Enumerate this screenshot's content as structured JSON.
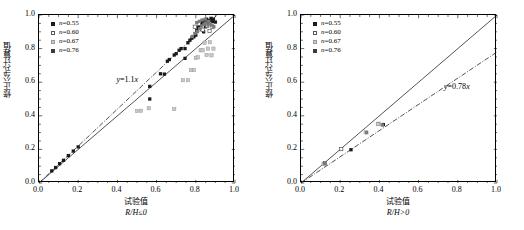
{
  "figure": {
    "panels": [
      {
        "id": "left",
        "condition_label": "R/H≤0",
        "xlabel": "试验值",
        "ylabel": "修正公式计算值",
        "equation": "y=1.1x",
        "equation_slope": 1.1
      },
      {
        "id": "right",
        "condition_label": "R/H>0",
        "xlabel": "试验值",
        "ylabel": "修正公式计算值",
        "equation": "y=0.78x",
        "equation_slope": 0.78
      }
    ],
    "legend": [
      {
        "label": "n=0.55",
        "marker": "filled-square",
        "color": "#1a1a1a"
      },
      {
        "label": "n=0.60",
        "marker": "open-square",
        "color": "#ffffff"
      },
      {
        "label": "n=0.67",
        "marker": "light-square",
        "color": "#c8c8c8"
      },
      {
        "label": "n=0.76",
        "marker": "filled-square",
        "color": "#3a3a3a"
      }
    ],
    "ticks": {
      "x": [
        "0.0",
        "0.2",
        "0.4",
        "0.6",
        "0.8",
        "1.0"
      ],
      "y": [
        "0.0",
        "0.2",
        "0.4",
        "0.6",
        "0.8",
        "1.0"
      ]
    }
  },
  "chart_data": [
    {
      "type": "scatter",
      "panel": "left",
      "title": "",
      "xlabel": "试验值 R/H≤0",
      "ylabel": "修正公式计算值",
      "xlim": [
        0.0,
        1.0
      ],
      "ylim": [
        0.0,
        1.0
      ],
      "grid": false,
      "legend_position": "top-left",
      "annotations": [
        {
          "text": "y=1.1x",
          "x": 0.4,
          "y": 0.605
        }
      ],
      "reference_lines": [
        {
          "name": "one-to-one",
          "style": "solid",
          "slope": 1.0,
          "intercept": 0.0
        },
        {
          "name": "fit",
          "style": "dash-dot",
          "slope": 1.1,
          "intercept": 0.0
        }
      ],
      "series": [
        {
          "name": "n=0.55",
          "marker": "filled-square",
          "color": "#1a1a1a",
          "points": [
            [
              0.065,
              0.072
            ],
            [
              0.085,
              0.092
            ],
            [
              0.105,
              0.115
            ],
            [
              0.125,
              0.135
            ],
            [
              0.15,
              0.163
            ],
            [
              0.175,
              0.19
            ],
            [
              0.2,
              0.215
            ],
            [
              0.565,
              0.575
            ],
            [
              0.565,
              0.5
            ],
            [
              0.62,
              0.65
            ],
            [
              0.64,
              0.648
            ],
            [
              0.655,
              0.725
            ],
            [
              0.665,
              0.735
            ],
            [
              0.69,
              0.762
            ],
            [
              0.7,
              0.77
            ],
            [
              0.715,
              0.79
            ],
            [
              0.725,
              0.8
            ],
            [
              0.745,
              0.742
            ],
            [
              0.745,
              0.8
            ],
            [
              0.76,
              0.835
            ],
            [
              0.77,
              0.85
            ],
            [
              0.78,
              0.862
            ],
            [
              0.79,
              0.87
            ],
            [
              0.8,
              0.88
            ],
            [
              0.805,
              0.908
            ],
            [
              0.812,
              0.925
            ],
            [
              0.82,
              0.94
            ],
            [
              0.828,
              0.948
            ],
            [
              0.835,
              0.958
            ],
            [
              0.84,
              0.9
            ],
            [
              0.845,
              0.965
            ],
            [
              0.85,
              0.93
            ],
            [
              0.855,
              0.975
            ],
            [
              0.862,
              0.955
            ],
            [
              0.87,
              0.968
            ],
            [
              0.878,
              0.98
            ],
            [
              0.885,
              0.962
            ],
            [
              0.89,
              0.975
            ],
            [
              0.9,
              0.958
            ]
          ]
        },
        {
          "name": "n=0.60",
          "marker": "open-square",
          "color": "#ffffff",
          "points": [
            [
              0.795,
              0.93
            ],
            [
              0.815,
              0.948
            ],
            [
              0.835,
              0.912
            ],
            [
              0.858,
              0.935
            ],
            [
              0.87,
              0.905
            ],
            [
              0.885,
              0.93
            ]
          ]
        },
        {
          "name": "n=0.67",
          "marker": "light-square",
          "color": "#c8c8c8",
          "points": [
            [
              0.5,
              0.428
            ],
            [
              0.52,
              0.43
            ],
            [
              0.56,
              0.445
            ],
            [
              0.69,
              0.44
            ],
            [
              0.735,
              0.612
            ],
            [
              0.76,
              0.612
            ],
            [
              0.775,
              0.672
            ],
            [
              0.79,
              0.672
            ],
            [
              0.8,
              0.745
            ],
            [
              0.81,
              0.748
            ],
            [
              0.825,
              0.79
            ],
            [
              0.835,
              0.79
            ],
            [
              0.845,
              0.835
            ],
            [
              0.855,
              0.762
            ],
            [
              0.862,
              0.8
            ],
            [
              0.872,
              0.838
            ],
            [
              0.88,
              0.76
            ],
            [
              0.89,
              0.8
            ]
          ]
        },
        {
          "name": "n=0.76",
          "marker": "filled-square",
          "color": "#7a7a7a",
          "points": [
            [
              0.782,
              0.872
            ],
            [
              0.795,
              0.89
            ],
            [
              0.808,
              0.902
            ],
            [
              0.82,
              0.918
            ],
            [
              0.83,
              0.935
            ],
            [
              0.842,
              0.945
            ],
            [
              0.852,
              0.952
            ],
            [
              0.862,
              0.94
            ],
            [
              0.872,
              0.948
            ],
            [
              0.882,
              0.94
            ],
            [
              0.892,
              0.93
            ],
            [
              0.805,
              0.955
            ],
            [
              0.818,
              0.962
            ],
            [
              0.832,
              0.97
            ],
            [
              0.848,
              0.975
            ],
            [
              0.866,
              0.962
            ]
          ]
        }
      ]
    },
    {
      "type": "scatter",
      "panel": "right",
      "title": "",
      "xlabel": "试验值 R/H>0",
      "ylabel": "修正公式计算值",
      "xlim": [
        0.0,
        1.0
      ],
      "ylim": [
        0.0,
        1.0
      ],
      "grid": false,
      "legend_position": "top-left",
      "annotations": [
        {
          "text": "y=0.78x",
          "x": 0.735,
          "y": 0.565
        }
      ],
      "reference_lines": [
        {
          "name": "one-to-one",
          "style": "solid",
          "slope": 1.0,
          "intercept": 0.0
        },
        {
          "name": "fit",
          "style": "dash-dot",
          "slope": 0.78,
          "intercept": 0.0
        }
      ],
      "series": [
        {
          "name": "n=0.55",
          "marker": "filled-square",
          "color": "#1a1a1a",
          "points": [
            [
              0.118,
              0.115
            ],
            [
              0.255,
              0.198
            ],
            [
              0.42,
              0.348
            ]
          ]
        },
        {
          "name": "n=0.60",
          "marker": "open-square",
          "color": "#ffffff",
          "points": [
            [
              0.122,
              0.118
            ],
            [
              0.205,
              0.202
            ],
            [
              0.395,
              0.352
            ]
          ]
        },
        {
          "name": "n=0.67",
          "marker": "light-square",
          "color": "#c8c8c8",
          "points": [
            [
              0.115,
              0.112
            ],
            [
              0.33,
              0.302
            ],
            [
              0.392,
              0.35
            ]
          ]
        },
        {
          "name": "n=0.76",
          "marker": "filled-square",
          "color": "#7a7a7a",
          "points": [
            [
              0.12,
              0.116
            ],
            [
              0.335,
              0.3
            ],
            [
              0.415,
              0.345
            ]
          ]
        }
      ]
    }
  ]
}
